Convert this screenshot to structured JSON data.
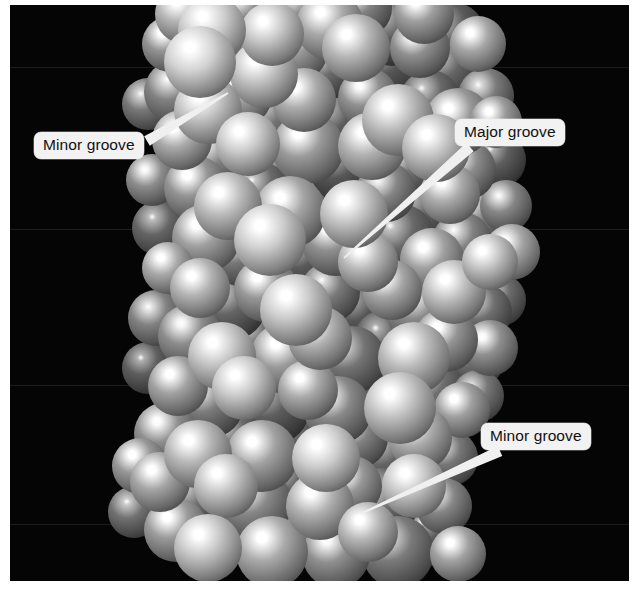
{
  "figure": {
    "background_color": "#050505",
    "plate": {
      "x": 10,
      "y": 5,
      "width": 619,
      "height": 576
    }
  },
  "labels": [
    {
      "id": "minor-groove-top",
      "text": "Minor groove",
      "box": {
        "x": 34,
        "y": 132,
        "width": 113,
        "height": 28
      },
      "leader": {
        "from_x": 147,
        "from_y": 141,
        "to_x": 228,
        "to_y": 93
      },
      "box_color": "#f2f2f2",
      "text_color": "#111111",
      "leader_color": "#f0f0f0"
    },
    {
      "id": "major-groove",
      "text": "Major groove",
      "box": {
        "x": 455,
        "y": 119,
        "width": 116,
        "height": 28
      },
      "leader": {
        "from_x": 470,
        "from_y": 147,
        "to_x": 344,
        "to_y": 258
      },
      "box_color": "#f2f2f2",
      "text_color": "#111111",
      "leader_color": "#f0f0f0"
    },
    {
      "id": "minor-groove-bottom",
      "text": "Minor groove",
      "box": {
        "x": 481,
        "y": 423,
        "width": 113,
        "height": 28
      },
      "leader": {
        "from_x": 500,
        "from_y": 451,
        "to_x": 362,
        "to_y": 513
      },
      "box_color": "#f2f2f2",
      "text_color": "#111111",
      "leader_color": "#f0f0f0"
    }
  ],
  "atoms": [
    [
      185,
      14,
      30,
      0.78
    ],
    [
      212,
      30,
      34,
      0.92
    ],
    [
      246,
      10,
      30,
      0.55
    ],
    [
      272,
      34,
      32,
      0.88
    ],
    [
      300,
      12,
      28,
      0.4
    ],
    [
      330,
      26,
      34,
      0.72
    ],
    [
      362,
      8,
      30,
      0.5
    ],
    [
      392,
      30,
      36,
      0.3
    ],
    [
      424,
      14,
      30,
      0.66
    ],
    [
      452,
      36,
      34,
      0.28
    ],
    [
      170,
      44,
      28,
      0.6
    ],
    [
      200,
      62,
      36,
      0.95
    ],
    [
      236,
      52,
      30,
      0.44
    ],
    [
      264,
      74,
      34,
      0.86
    ],
    [
      296,
      50,
      32,
      0.62
    ],
    [
      326,
      70,
      30,
      0.38
    ],
    [
      356,
      48,
      34,
      0.8
    ],
    [
      388,
      66,
      36,
      0.26
    ],
    [
      420,
      48,
      30,
      0.58
    ],
    [
      448,
      70,
      32,
      0.34
    ],
    [
      478,
      44,
      28,
      0.7
    ],
    [
      176,
      92,
      32,
      0.5
    ],
    [
      208,
      110,
      34,
      0.88
    ],
    [
      242,
      96,
      30,
      0.66
    ],
    [
      270,
      118,
      36,
      0.42
    ],
    [
      304,
      100,
      32,
      0.74
    ],
    [
      336,
      122,
      34,
      0.3
    ],
    [
      368,
      98,
      30,
      0.58
    ],
    [
      398,
      120,
      36,
      0.84
    ],
    [
      430,
      100,
      30,
      0.36
    ],
    [
      458,
      122,
      34,
      0.62
    ],
    [
      486,
      96,
      28,
      0.46
    ],
    [
      182,
      140,
      30,
      0.72
    ],
    [
      214,
      158,
      34,
      0.5
    ],
    [
      248,
      144,
      32,
      0.9
    ],
    [
      278,
      166,
      30,
      0.34
    ],
    [
      308,
      148,
      36,
      0.64
    ],
    [
      342,
      170,
      32,
      0.26
    ],
    [
      372,
      146,
      34,
      0.78
    ],
    [
      404,
      168,
      30,
      0.44
    ],
    [
      436,
      148,
      34,
      0.86
    ],
    [
      466,
      170,
      30,
      0.56
    ],
    [
      196,
      188,
      32,
      0.6
    ],
    [
      228,
      206,
      34,
      0.82
    ],
    [
      260,
      192,
      30,
      0.38
    ],
    [
      290,
      212,
      36,
      0.7
    ],
    [
      324,
      194,
      32,
      0.24
    ],
    [
      354,
      214,
      34,
      0.88
    ],
    [
      386,
      192,
      30,
      0.52
    ],
    [
      418,
      212,
      36,
      0.32
    ],
    [
      450,
      194,
      30,
      0.74
    ],
    [
      478,
      216,
      32,
      0.48
    ],
    [
      206,
      238,
      34,
      0.66
    ],
    [
      240,
      256,
      30,
      0.44
    ],
    [
      270,
      240,
      36,
      0.92
    ],
    [
      304,
      260,
      32,
      0.28
    ],
    [
      336,
      242,
      34,
      0.58
    ],
    [
      368,
      262,
      30,
      0.8
    ],
    [
      400,
      240,
      36,
      0.36
    ],
    [
      432,
      260,
      32,
      0.68
    ],
    [
      462,
      242,
      30,
      0.5
    ],
    [
      490,
      262,
      28,
      0.86
    ],
    [
      200,
      288,
      30,
      0.78
    ],
    [
      232,
      306,
      34,
      0.34
    ],
    [
      266,
      290,
      32,
      0.62
    ],
    [
      296,
      310,
      36,
      0.9
    ],
    [
      330,
      292,
      30,
      0.46
    ],
    [
      360,
      312,
      34,
      0.26
    ],
    [
      392,
      290,
      30,
      0.7
    ],
    [
      422,
      310,
      36,
      0.54
    ],
    [
      454,
      292,
      32,
      0.84
    ],
    [
      484,
      312,
      28,
      0.4
    ],
    [
      190,
      336,
      32,
      0.56
    ],
    [
      222,
      356,
      34,
      0.88
    ],
    [
      256,
      340,
      30,
      0.32
    ],
    [
      286,
      358,
      36,
      0.64
    ],
    [
      320,
      338,
      32,
      0.76
    ],
    [
      352,
      360,
      34,
      0.42
    ],
    [
      384,
      340,
      30,
      0.28
    ],
    [
      414,
      358,
      36,
      0.82
    ],
    [
      446,
      340,
      32,
      0.6
    ],
    [
      476,
      360,
      28,
      0.36
    ],
    [
      178,
      386,
      30,
      0.68
    ],
    [
      210,
      404,
      34,
      0.46
    ],
    [
      244,
      388,
      32,
      0.9
    ],
    [
      274,
      408,
      36,
      0.3
    ],
    [
      308,
      390,
      30,
      0.72
    ],
    [
      338,
      410,
      34,
      0.54
    ],
    [
      370,
      388,
      30,
      0.24
    ],
    [
      400,
      408,
      36,
      0.86
    ],
    [
      432,
      390,
      32,
      0.4
    ],
    [
      462,
      410,
      28,
      0.66
    ],
    [
      166,
      434,
      32,
      0.58
    ],
    [
      198,
      454,
      34,
      0.8
    ],
    [
      232,
      438,
      30,
      0.36
    ],
    [
      262,
      456,
      36,
      0.68
    ],
    [
      296,
      436,
      32,
      0.26
    ],
    [
      326,
      458,
      34,
      0.92
    ],
    [
      358,
      438,
      30,
      0.5
    ],
    [
      388,
      456,
      36,
      0.34
    ],
    [
      420,
      438,
      32,
      0.74
    ],
    [
      450,
      458,
      28,
      0.44
    ],
    [
      160,
      482,
      30,
      0.7
    ],
    [
      192,
      500,
      34,
      0.4
    ],
    [
      226,
      486,
      32,
      0.86
    ],
    [
      256,
      504,
      36,
      0.54
    ],
    [
      290,
      484,
      30,
      0.3
    ],
    [
      320,
      506,
      34,
      0.76
    ],
    [
      352,
      486,
      30,
      0.62
    ],
    [
      382,
      504,
      36,
      0.38
    ],
    [
      414,
      486,
      32,
      0.88
    ],
    [
      444,
      506,
      28,
      0.52
    ],
    [
      176,
      530,
      32,
      0.64
    ],
    [
      208,
      548,
      34,
      0.88
    ],
    [
      242,
      532,
      30,
      0.42
    ],
    [
      272,
      552,
      36,
      0.72
    ],
    [
      306,
      534,
      32,
      0.34
    ],
    [
      336,
      554,
      34,
      0.58
    ],
    [
      368,
      532,
      30,
      0.8
    ],
    [
      398,
      552,
      36,
      0.46
    ],
    [
      430,
      534,
      32,
      0.28
    ],
    [
      458,
      554,
      28,
      0.68
    ],
    [
      498,
      160,
      28,
      0.3
    ],
    [
      506,
      206,
      26,
      0.52
    ],
    [
      512,
      252,
      28,
      0.7
    ],
    [
      500,
      300,
      26,
      0.38
    ],
    [
      490,
      348,
      28,
      0.58
    ],
    [
      478,
      396,
      26,
      0.44
    ],
    [
      496,
      122,
      26,
      0.64
    ],
    [
      148,
      104,
      26,
      0.44
    ],
    [
      152,
      180,
      26,
      0.56
    ],
    [
      160,
      228,
      28,
      0.34
    ],
    [
      168,
      268,
      26,
      0.72
    ],
    [
      156,
      318,
      28,
      0.5
    ],
    [
      148,
      368,
      26,
      0.3
    ],
    [
      140,
      466,
      28,
      0.62
    ],
    [
      134,
      512,
      26,
      0.4
    ]
  ]
}
